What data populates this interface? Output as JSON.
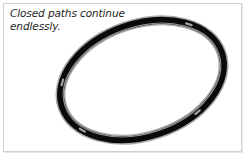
{
  "figure": {
    "caption": "Closed paths continue\nendlessly.",
    "caption_line1": "Closed paths continue",
    "caption_line2": "endlessly.",
    "background_color": "#ffffff",
    "frame_color": "#cfcfcf",
    "caption_color": "#1d1d1d"
  },
  "illustration": {
    "name": "closed-elliptical-path",
    "description": "A single thick black closed loop drawn as a tilted ellipse, rendered like a rope or ring, with a thin light highlight line running along the inside of the band.",
    "shape": "ellipse",
    "stroke_color": "#0a0a0a",
    "highlight_color": "#b3b3b3",
    "inner_line_color": "#9e9e9e",
    "center_x": 142,
    "center_y": 80,
    "radius_x": 84,
    "radius_y": 56,
    "rotation_deg": -19,
    "band_width": 7,
    "highlight_marks": [
      {
        "name": "highlight-top-left",
        "t_deg": 205
      },
      {
        "name": "highlight-right",
        "t_deg": 318
      },
      {
        "name": "highlight-bottom",
        "t_deg": 60
      },
      {
        "name": "highlight-left",
        "t_deg": 150
      }
    ]
  }
}
